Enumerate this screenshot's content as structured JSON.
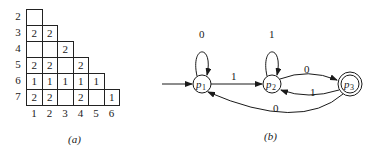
{
  "figure_a": {
    "caption": "(a)",
    "row_labels": [
      "2",
      "3",
      "4",
      "5",
      "6",
      "7"
    ],
    "col_labels": [
      "1",
      "2",
      "3",
      "4",
      "5",
      "6"
    ],
    "rows": [
      [
        ""
      ],
      [
        "2",
        "2"
      ],
      [
        "",
        "",
        "2"
      ],
      [
        "2",
        "2",
        "",
        "2"
      ],
      [
        "1",
        "1",
        "1",
        "1",
        "1"
      ],
      [
        "2",
        "2",
        "",
        "2",
        "",
        "1"
      ]
    ]
  },
  "figure_b": {
    "caption": "(b)",
    "states": [
      {
        "id": "p1",
        "label": "p",
        "sub": "1",
        "start": true,
        "accepting": false
      },
      {
        "id": "p2",
        "label": "p",
        "sub": "2",
        "start": false,
        "accepting": false
      },
      {
        "id": "p3",
        "label": "p",
        "sub": "3",
        "start": false,
        "accepting": true
      }
    ],
    "transitions": [
      {
        "from": "p1",
        "to": "p1",
        "label": "0"
      },
      {
        "from": "p1",
        "to": "p2",
        "label": "1"
      },
      {
        "from": "p2",
        "to": "p2",
        "label": "1"
      },
      {
        "from": "p2",
        "to": "p3",
        "label": "0"
      },
      {
        "from": "p3",
        "to": "p2",
        "label": "1"
      },
      {
        "from": "p3",
        "to": "p1",
        "label": "0"
      }
    ]
  }
}
